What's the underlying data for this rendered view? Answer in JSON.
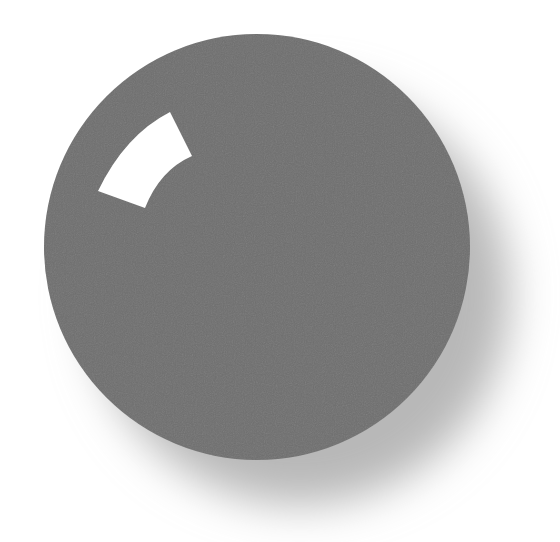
{
  "scene": {
    "description": "Gray sphere with white curved highlight and soft drop shadow",
    "background_color": "#ffffff",
    "sphere": {
      "cx": 257,
      "cy": 247,
      "r": 213,
      "color": "#6e6e6e"
    },
    "shadow": {
      "cx": 300,
      "cy": 295,
      "r": 210,
      "color": "#b8b8b8",
      "blur": 22
    },
    "highlight": {
      "color": "#ffffff",
      "shape": "annular-sector",
      "path": "M170 112 L192 156 Q160 170 145 208 L98 191 Q125 135 170 112 Z"
    }
  }
}
